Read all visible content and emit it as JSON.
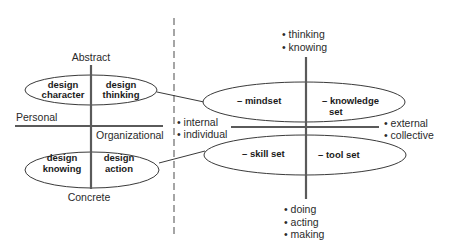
{
  "colors": {
    "background": "#ffffff",
    "axis": "#5a5a5a",
    "outline": "#3a3a3a",
    "text": "#2a2a2a",
    "divider": "#6a6a6a"
  },
  "left_panel": {
    "axis_labels": {
      "top": "Abstract",
      "bottom": "Concrete",
      "left": "Personal",
      "right": "Organizational"
    },
    "top_ellipse": {
      "left": {
        "line1": "design",
        "line2": "character"
      },
      "right": {
        "line1": "design",
        "line2": "thinking"
      }
    },
    "bottom_ellipse": {
      "left": {
        "line1": "design",
        "line2": "knowing"
      },
      "right": {
        "line1": "design",
        "line2": "action"
      }
    }
  },
  "right_panel": {
    "top_ellipse": {
      "left": "– mindset",
      "right_line1": "– knowledge",
      "right_line2": "set"
    },
    "bottom_ellipse": {
      "left": "– skill set",
      "right": "– tool set"
    },
    "top_labels": [
      "• thinking",
      "• knowing"
    ],
    "bottom_labels": [
      "• doing",
      "• acting",
      "• making"
    ],
    "left_labels": [
      "• internal",
      "• individual"
    ],
    "right_labels": [
      "• external",
      "• collective"
    ]
  }
}
